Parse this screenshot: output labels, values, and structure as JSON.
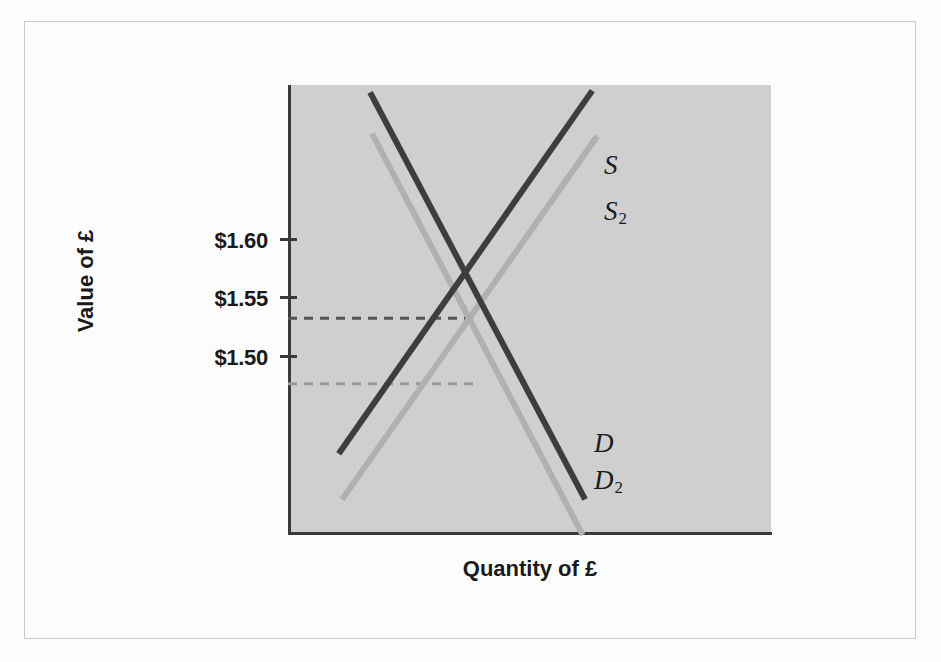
{
  "chart_data": {
    "type": "line",
    "title": "",
    "xlabel": "Quantity of £",
    "ylabel": "Value of £",
    "y_ticks": [
      "$1.60",
      "$1.55",
      "$1.50"
    ],
    "y_tick_values": [
      1.6,
      1.55,
      1.5
    ],
    "ylim": [
      1.435,
      1.675
    ],
    "x_ticks": [],
    "grid": false,
    "legend": "inline-curve-labels",
    "annotations": [
      {
        "name": "equilibrium-dashed-line-1",
        "label": "$1.55",
        "value": 1.55,
        "style": "dashed",
        "color": "#555555"
      },
      {
        "name": "equilibrium-dashed-line-2",
        "label": "",
        "value": 1.515,
        "style": "dashed",
        "color": "#9a9a9a"
      }
    ],
    "series": [
      {
        "name": "S",
        "label": "S",
        "role": "supply",
        "color": "#3d3d3d",
        "points": [
          [
            0.105,
            1.4775
          ],
          [
            0.63,
            1.672
          ]
        ]
      },
      {
        "name": "S2",
        "label": "S₂",
        "role": "supply-shifted",
        "color": "#b0b0b0",
        "points": [
          [
            0.112,
            1.453
          ],
          [
            0.64,
            1.6475
          ]
        ]
      },
      {
        "name": "D",
        "label": "D",
        "role": "demand",
        "color": "#3d3d3d",
        "points": [
          [
            0.17,
            1.671
          ],
          [
            0.615,
            1.453
          ]
        ]
      },
      {
        "name": "D2",
        "label": "D₂",
        "role": "demand-shifted",
        "color": "#b0b0b0",
        "points": [
          [
            0.174,
            1.649
          ],
          [
            0.61,
            1.434
          ]
        ]
      }
    ],
    "equilibria": [
      {
        "name": "equilibrium-original",
        "price": 1.55,
        "series": [
          "S",
          "D"
        ]
      },
      {
        "name": "equilibrium-new",
        "price": 1.515,
        "series": [
          "S2",
          "D2"
        ]
      }
    ],
    "colors": {
      "panel_background": "#cfcfcf",
      "page_background": "#fdfdfd",
      "axis": "#3a3a3a",
      "dark_curve": "#3d3d3d",
      "light_curve": "#b0b0b0",
      "text": "#1a1a1a"
    }
  },
  "labels": {
    "y_title": "Value of £",
    "x_title": "Quantity of £",
    "tick_160": "$1.60",
    "tick_155": "$1.55",
    "tick_150": "$1.50",
    "curve_s": "S",
    "curve_s2_base": "S",
    "curve_s2_sub": "2",
    "curve_d": "D",
    "curve_d2_base": "D",
    "curve_d2_sub": "2"
  }
}
